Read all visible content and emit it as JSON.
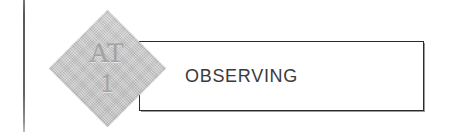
{
  "figure": {
    "type": "process-stage-banner",
    "background_color": "#ffffff"
  },
  "margin_rule": {
    "name": "page-margin-rule",
    "color": "#4f4f4f"
  },
  "badge": {
    "shape": "diamond",
    "code": "AT",
    "number": "1",
    "fill_color": "#c5c5c5",
    "text_color": "#a3a3a3"
  },
  "stage": {
    "label": "OBSERVING",
    "border_color": "#2b2b2b",
    "text_color": "#3a3a3a",
    "fill_color": "#ffffff"
  }
}
